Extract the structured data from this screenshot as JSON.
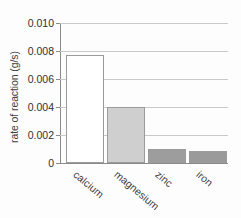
{
  "chart_data": {
    "type": "bar",
    "title": "",
    "xlabel": "",
    "ylabel": "rate of reaction (g/s)",
    "categories": [
      "calcium",
      "magnesium",
      "zinc",
      "iron"
    ],
    "values": [
      0.0077,
      0.004,
      0.001,
      0.00085
    ],
    "ylim": [
      0,
      0.01
    ],
    "ytick_values": [
      0,
      0.002,
      0.004,
      0.006,
      0.008,
      0.01
    ],
    "ytick_labels": [
      "0",
      "0.002",
      "0.004",
      "0.006",
      "0.008",
      "0.010"
    ],
    "grid": "horizontal",
    "legend": "none",
    "bar_colors": [
      "#ffffff",
      "#cfcfcf",
      "#9d9d9d",
      "#9a9a9a"
    ],
    "bar_edge_color": "#9b9b9b",
    "axis_color": "#8a8a8a",
    "gridline_color": "#c9c9c9",
    "background_color": "#fdfdfd"
  }
}
